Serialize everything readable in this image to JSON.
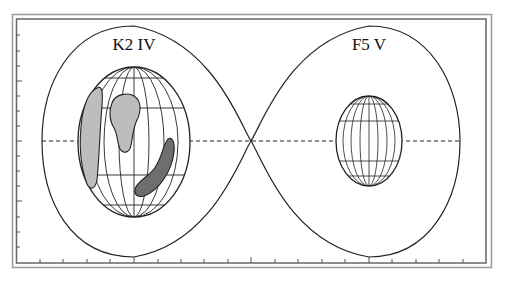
{
  "figure": {
    "type": "roche-lobe-binary-diagram",
    "colors": {
      "line": "#222222",
      "frame": "#888888",
      "spot_light": "#bdbdbd",
      "spot_dark": "#6e6e6e",
      "background": "#ffffff"
    }
  },
  "stars": [
    {
      "label": "K2 IV",
      "role": "primary",
      "spots": [
        {
          "shade": "light",
          "position": "left limb"
        },
        {
          "shade": "light",
          "position": "upper center"
        },
        {
          "shade": "dark",
          "position": "lower right"
        }
      ]
    },
    {
      "label": "F5 V",
      "role": "secondary",
      "spots": []
    }
  ],
  "axes": {
    "left_ticks": 16,
    "bottom_ticks": 19
  }
}
